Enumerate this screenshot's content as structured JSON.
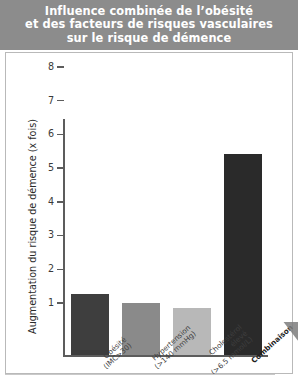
{
  "title": {
    "text": "Influence combinée de l’obésité\net des facteurs de risques vasculaires\nsur le risque de démence",
    "background_color": "#8c8c8c",
    "text_color": "#ffffff"
  },
  "chart_data": {
    "type": "bar",
    "title": "Influence combinée de l’obésité et des facteurs de risques vasculaires sur le risque de démence",
    "xlabel": "",
    "ylabel": "Augmentation du risque de démence (x fois)",
    "ylim": [
      1,
      8
    ],
    "yticks": [
      1,
      2,
      3,
      4,
      5,
      6,
      7,
      8
    ],
    "ytick_labels": [
      "1",
      "2",
      "3",
      "4",
      "5",
      "6",
      "7",
      "8"
    ],
    "grid": false,
    "legend": "none",
    "categories": [
      "Obésité\n(IMC>30)",
      "Hypertension\n(>140 mmHg)",
      "Cholestérol\nélevé\n(>6.5 mmol/L)",
      "Combinaison"
    ],
    "values": [
      2.8,
      2.55,
      2.4,
      6.95
    ],
    "bar_colors": [
      "#3e3e3e",
      "#8a8a8a",
      "#b8b8b8",
      "#2a2a2a"
    ],
    "bars": [
      {
        "label": "Obésité\n(IMC>30)",
        "value": 2.8,
        "color": "#3e3e3e",
        "bold_label": false
      },
      {
        "label": "Hypertension\n(>140 mmHg)",
        "value": 2.55,
        "color": "#8a8a8a",
        "bold_label": false
      },
      {
        "label": "Cholestérol\nélevé\n(>6.5 mmol/L)",
        "value": 2.4,
        "color": "#b8b8b8",
        "bold_label": false
      },
      {
        "label": "Combinaison",
        "value": 6.95,
        "color": "#2a2a2a",
        "bold_label": true
      }
    ]
  },
  "axis": {
    "y_title": "Augmentation du risque de démence (x fois)",
    "axis_color": "#5c5c5c"
  }
}
